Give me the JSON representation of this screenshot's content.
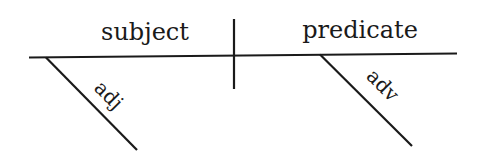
{
  "diagram": {
    "type": "sentence-diagram",
    "labels": {
      "subject": "subject",
      "predicate": "predicate",
      "subject_modifier": "adj",
      "predicate_modifier": "adv"
    },
    "colors": {
      "line": "#1a1a1a",
      "text": "#1a1a1a",
      "background": "#ffffff"
    }
  }
}
